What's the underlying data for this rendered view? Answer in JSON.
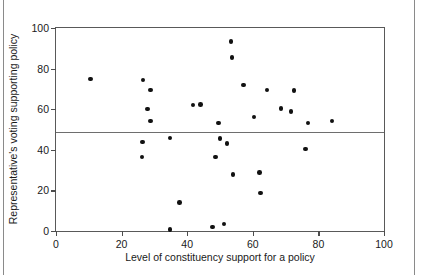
{
  "chart_data": {
    "type": "scatter",
    "title": "",
    "xlabel": "Level of constituency support for a policy",
    "ylabel": "Representative's voting supporting policy",
    "xlim": [
      0,
      100
    ],
    "ylim": [
      0,
      100
    ],
    "xticks": [
      0,
      20,
      40,
      60,
      80,
      100
    ],
    "yticks": [
      0,
      20,
      40,
      60,
      80,
      100
    ],
    "xtick_labels": [
      "0",
      "20",
      "40",
      "60",
      "80",
      "100"
    ],
    "ytick_labels": [
      "0",
      "20",
      "40",
      "60",
      "80",
      "100"
    ],
    "grid": false,
    "legend": null,
    "reference_lines": [
      {
        "orientation": "horizontal",
        "value": 49,
        "color": "#6e6e6e"
      }
    ],
    "marker": {
      "shape": "circle",
      "color": "#111111",
      "size": 4.6
    },
    "points": [
      {
        "x": 10.6,
        "y": 74.8
      },
      {
        "x": 26.5,
        "y": 74.4
      },
      {
        "x": 26.3,
        "y": 43.9
      },
      {
        "x": 26.2,
        "y": 36.4
      },
      {
        "x": 28.8,
        "y": 69.5
      },
      {
        "x": 27.9,
        "y": 60.0
      },
      {
        "x": 28.8,
        "y": 54.2
      },
      {
        "x": 34.8,
        "y": 45.8
      },
      {
        "x": 34.7,
        "y": 0.7
      },
      {
        "x": 37.6,
        "y": 14.0
      },
      {
        "x": 41.8,
        "y": 62.1
      },
      {
        "x": 44.1,
        "y": 62.3
      },
      {
        "x": 47.7,
        "y": 2.0
      },
      {
        "x": 48.6,
        "y": 36.4
      },
      {
        "x": 49.5,
        "y": 53.2
      },
      {
        "x": 50.0,
        "y": 45.6
      },
      {
        "x": 51.2,
        "y": 3.4
      },
      {
        "x": 52.1,
        "y": 43.0
      },
      {
        "x": 53.3,
        "y": 93.4
      },
      {
        "x": 53.7,
        "y": 85.5
      },
      {
        "x": 54.0,
        "y": 27.9
      },
      {
        "x": 57.2,
        "y": 72.0
      },
      {
        "x": 60.4,
        "y": 56.2
      },
      {
        "x": 62.0,
        "y": 28.8
      },
      {
        "x": 62.4,
        "y": 18.7
      },
      {
        "x": 64.3,
        "y": 69.4
      },
      {
        "x": 68.6,
        "y": 60.2
      },
      {
        "x": 71.6,
        "y": 58.8
      },
      {
        "x": 72.5,
        "y": 69.2
      },
      {
        "x": 76.0,
        "y": 40.3
      },
      {
        "x": 76.8,
        "y": 53.3
      },
      {
        "x": 84.2,
        "y": 54.1
      }
    ]
  }
}
